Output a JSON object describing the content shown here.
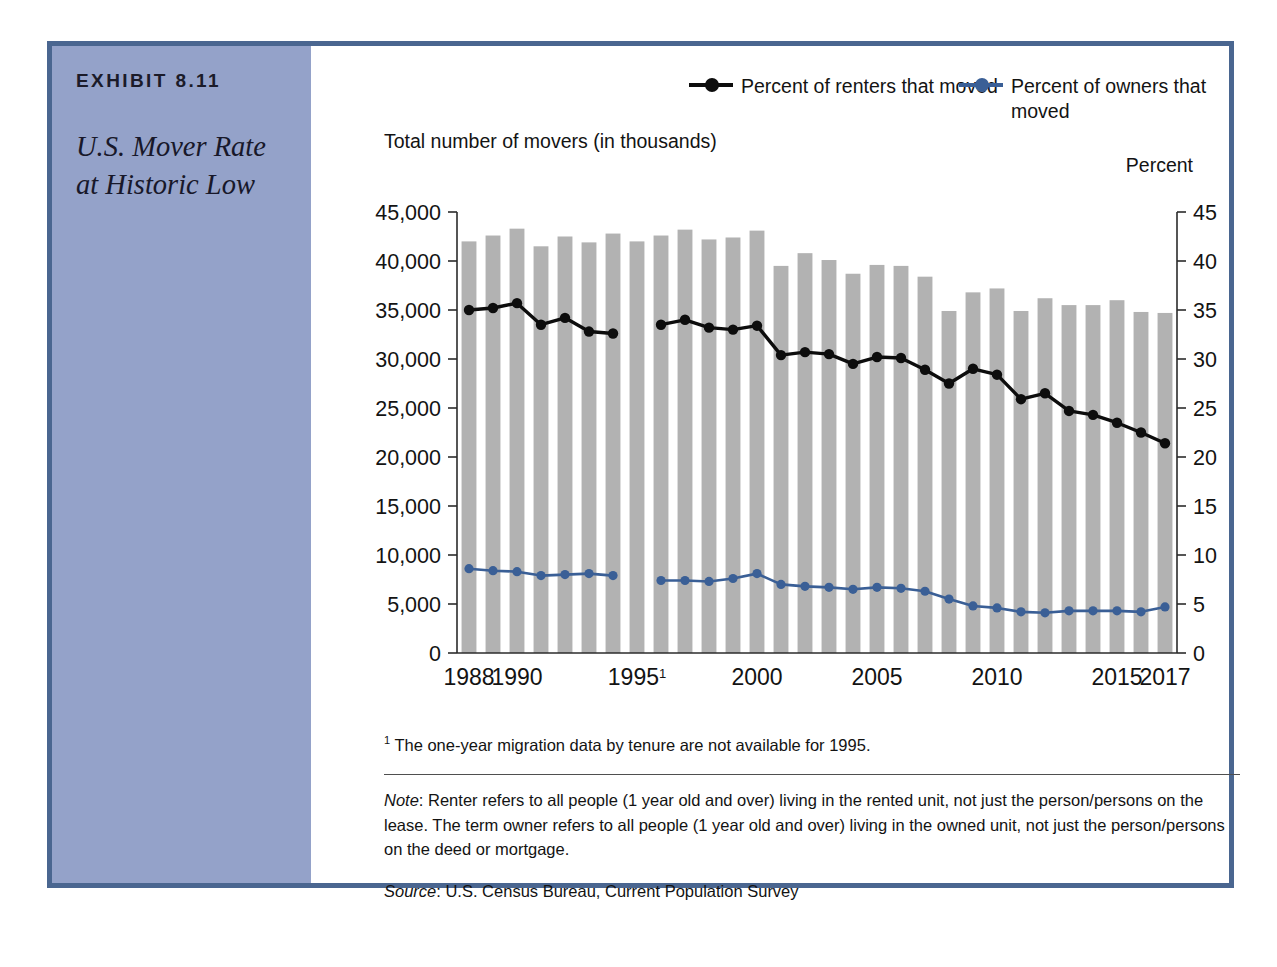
{
  "exhibit": {
    "label": "EXHIBIT 8.11",
    "title": "U.S. Mover Rate at Historic Low"
  },
  "legend": {
    "renters": "Percent of renters that moved",
    "owners": "Percent of owners that moved",
    "renters_color": "#0d0d0d",
    "owners_color": "#3a5f96"
  },
  "axis_captions": {
    "left": "Total number of movers (in thousands)",
    "right": "Percent"
  },
  "footnote": "The one-year migration data by tenure are not available for 1995.",
  "footnote_marker": "1",
  "note_prefix": "Note",
  "note": ": Renter refers to all people (1 year old and over) living in the rented unit, not just the person/persons on the lease. The term owner refers to all people (1 year old and over) living in the owned unit, not just the person/persons on the deed or mortgage.",
  "source_prefix": "Source",
  "source": ": U.S. Census Bureau, Current Population Survey",
  "chart_data": {
    "type": "bar",
    "title": "U.S. Mover Rate at Historic Low",
    "xlabel": "",
    "ylabel": "Total number of movers (in thousands)",
    "y2label": "Percent",
    "ylim": [
      0,
      45000
    ],
    "y2lim": [
      0,
      45
    ],
    "yticks": [
      0,
      5000,
      10000,
      15000,
      20000,
      25000,
      30000,
      35000,
      40000,
      45000
    ],
    "ytick_labels": [
      "0",
      "5,000",
      "10,000",
      "15,000",
      "20,000",
      "25,000",
      "30,000",
      "35,000",
      "40,000",
      "45,000"
    ],
    "y2ticks": [
      0,
      5,
      10,
      15,
      20,
      25,
      30,
      35,
      40,
      45
    ],
    "y2tick_labels": [
      "0",
      "5",
      "10",
      "15",
      "20",
      "25",
      "30",
      "35",
      "40",
      "45"
    ],
    "grid": false,
    "legend_position": "top-right",
    "bar_color": "#b2b2b2",
    "categories": [
      1988,
      1989,
      1990,
      1991,
      1992,
      1993,
      1994,
      1995,
      1996,
      1997,
      1998,
      1999,
      2000,
      2001,
      2002,
      2003,
      2004,
      2005,
      2006,
      2007,
      2008,
      2009,
      2010,
      2011,
      2012,
      2013,
      2014,
      2015,
      2016,
      2017
    ],
    "xtick_labels": [
      {
        "at": 1988,
        "label": "1988"
      },
      {
        "at": 1990,
        "label": "1990"
      },
      {
        "at": 1995,
        "label": "1995",
        "sup": "1"
      },
      {
        "at": 2000,
        "label": "2000"
      },
      {
        "at": 2005,
        "label": "2005"
      },
      {
        "at": 2010,
        "label": "2010"
      },
      {
        "at": 2015,
        "label": "2015"
      },
      {
        "at": 2017,
        "label": "2017"
      }
    ],
    "series": [
      {
        "name": "Total number of movers (in thousands)",
        "type": "bar",
        "axis": "left",
        "values": [
          42000,
          42600,
          43300,
          41500,
          42500,
          41900,
          42800,
          42000,
          42600,
          43200,
          42200,
          42400,
          43100,
          39500,
          40800,
          40100,
          38700,
          39600,
          39500,
          38400,
          34900,
          36800,
          37200,
          34900,
          36200,
          35500,
          35500,
          36000,
          34800,
          34700
        ]
      },
      {
        "name": "Percent of renters that moved",
        "type": "line",
        "axis": "right",
        "color": "#0d0d0d",
        "values": [
          35.0,
          35.2,
          35.7,
          33.5,
          34.2,
          32.8,
          32.6,
          null,
          33.5,
          34.0,
          33.2,
          33.0,
          33.4,
          30.4,
          30.7,
          30.5,
          29.5,
          30.2,
          30.1,
          28.9,
          27.5,
          29.0,
          28.4,
          25.9,
          26.5,
          24.7,
          24.3,
          23.5,
          22.5,
          21.4
        ]
      },
      {
        "name": "Percent of owners that moved",
        "type": "line",
        "axis": "right",
        "color": "#3a5f96",
        "values": [
          8.6,
          8.4,
          8.3,
          7.9,
          8.0,
          8.1,
          7.9,
          null,
          7.4,
          7.4,
          7.3,
          7.6,
          8.1,
          7.0,
          6.8,
          6.7,
          6.5,
          6.7,
          6.6,
          6.3,
          5.5,
          4.8,
          4.6,
          4.2,
          4.1,
          4.3,
          4.3,
          4.3,
          4.2,
          4.7
        ]
      }
    ]
  }
}
